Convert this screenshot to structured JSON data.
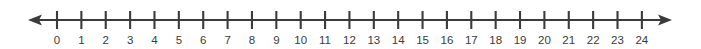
{
  "figure": {
    "kind": "number-line",
    "title": "",
    "background_color": "#ffffff",
    "ink_color": "#3b3b3b"
  },
  "chart_data": {
    "type": "number-line",
    "title": "",
    "xlabel": "",
    "ylabel": "",
    "orientation": "horizontal",
    "axis_min": 0,
    "axis_max": 24,
    "tick_interval": 1,
    "minor_ticks": false,
    "grid": false,
    "legend": null,
    "arrows": {
      "left": true,
      "right": true,
      "left_label": "arrow-left",
      "right_label": "arrow-right"
    },
    "tick_values": [
      0,
      1,
      2,
      3,
      4,
      5,
      6,
      7,
      8,
      9,
      10,
      11,
      12,
      13,
      14,
      15,
      16,
      17,
      18,
      19,
      20,
      21,
      22,
      23,
      24
    ],
    "tick_labels": [
      "0",
      "1",
      "2",
      "3",
      "4",
      "5",
      "6",
      "7",
      "8",
      "9",
      "10",
      "11",
      "12",
      "13",
      "14",
      "15",
      "16",
      "17",
      "18",
      "19",
      "20",
      "21",
      "22",
      "23",
      "24"
    ],
    "plotted_points": [],
    "annotations": []
  },
  "geometry": {
    "width": 701,
    "height": 49,
    "axis_y": 20,
    "tick_top": 11,
    "tick_bottom": 29,
    "label_baseline": 44,
    "first_tick_x": 57,
    "tick_spacing": 24.37,
    "line_start_x": 36,
    "line_end_x": 664,
    "arrow_left_tip_x": 28,
    "arrow_right_tip_x": 672,
    "arrow_half_height": 5.5
  }
}
